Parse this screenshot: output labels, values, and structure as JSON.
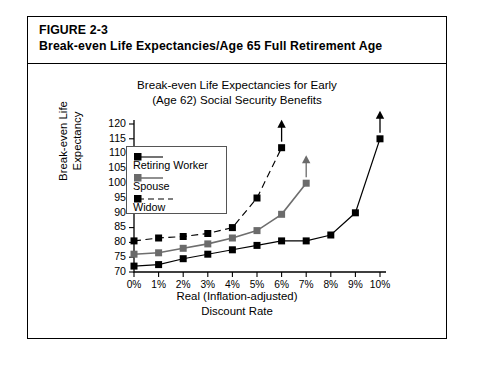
{
  "figure": {
    "label": "FIGURE 2-3",
    "caption": "Break-even Life Expectancies/Age 65 Full Retirement Age"
  },
  "chart_data": {
    "type": "line",
    "title": "Break-even Life Expectancies for Early (Age 62) Social Security Benefits",
    "title_line1": "Break-even Life Expectancies for Early",
    "title_line2": "(Age 62) Social Security Benefits",
    "xlabel": "Real (Inflation-adjusted) Discount Rate",
    "xlabel_line1": "Real (Inflation-adjusted)",
    "xlabel_line2": "Discount Rate",
    "ylabel": "Break-even Life Expectancy",
    "ylabel_line1": "Break-even Life",
    "ylabel_line2": "Expectancy",
    "xlim": [
      0,
      10
    ],
    "ylim": [
      70,
      120
    ],
    "ytick_step": 5,
    "grid": false,
    "legend_position": "upper-left-inside",
    "categories": [
      "0%",
      "1%",
      "2%",
      "3%",
      "4%",
      "5%",
      "6%",
      "7%",
      "8%",
      "9%",
      "10%"
    ],
    "ytick_labels": [
      "70",
      "75",
      "80",
      "85",
      "90",
      "95",
      "100",
      "105",
      "110",
      "115",
      "120"
    ],
    "series": [
      {
        "name": "Retiring Worker",
        "color": "#000000",
        "style": "solid",
        "x": [
          0,
          1,
          2,
          3,
          4,
          5,
          6,
          7,
          8,
          9,
          10
        ],
        "values": [
          72,
          72.5,
          74.5,
          76,
          77.5,
          79,
          80.5,
          80.5,
          82.5,
          90,
          115
        ],
        "terminal_arrow": true
      },
      {
        "name": "Spouse",
        "color": "#6b6b6b",
        "style": "solid",
        "x": [
          0,
          1,
          2,
          3,
          4,
          5,
          6,
          7
        ],
        "values": [
          76,
          76.5,
          78,
          79.5,
          81.5,
          84,
          89.5,
          100
        ],
        "terminal_arrow": true
      },
      {
        "name": "Widow",
        "color": "#000000",
        "style": "dashed",
        "x": [
          0,
          1,
          2,
          3,
          4,
          5,
          6
        ],
        "values": [
          80.5,
          81.5,
          82,
          83,
          85,
          95,
          112
        ],
        "terminal_arrow": true
      }
    ]
  },
  "legend": {
    "items": [
      {
        "label": "Retiring Worker",
        "color": "#000000",
        "style": "solid"
      },
      {
        "label": "Spouse",
        "color": "#6b6b6b",
        "style": "solid"
      },
      {
        "label": "Widow",
        "color": "#000000",
        "style": "dashed"
      }
    ]
  }
}
